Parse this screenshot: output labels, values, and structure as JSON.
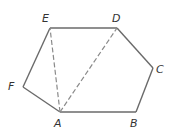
{
  "figure": {
    "type": "hexagon with diagonals",
    "vertices": {
      "A": {
        "label": "A",
        "x": 60,
        "y": 112,
        "lx": 54,
        "ly": 127
      },
      "B": {
        "label": "B",
        "x": 136,
        "y": 112,
        "lx": 130,
        "ly": 127
      },
      "C": {
        "label": "C",
        "x": 153,
        "y": 68,
        "lx": 156,
        "ly": 73
      },
      "D": {
        "label": "D",
        "x": 117,
        "y": 28,
        "lx": 112,
        "ly": 22
      },
      "E": {
        "label": "E",
        "x": 50,
        "y": 28,
        "lx": 42,
        "ly": 22
      },
      "F": {
        "label": "F",
        "x": 23,
        "y": 87,
        "lx": 8,
        "ly": 90
      }
    },
    "edges": [
      [
        "A",
        "B"
      ],
      [
        "B",
        "C"
      ],
      [
        "C",
        "D"
      ],
      [
        "D",
        "E"
      ],
      [
        "E",
        "F"
      ],
      [
        "F",
        "A"
      ]
    ],
    "dashed_diagonals": [
      [
        "A",
        "E"
      ],
      [
        "A",
        "D"
      ]
    ]
  }
}
